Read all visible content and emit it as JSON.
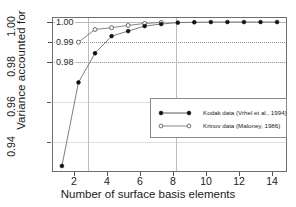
{
  "chart_data": {
    "type": "line",
    "title": "",
    "xlabel": "Number of surface basis elements",
    "ylabel": "Variance accounted for",
    "xlim": [
      0.4,
      14.6
    ],
    "ylim": [
      0.9255,
      1.0025
    ],
    "grid": true,
    "legend_position": "center-right",
    "x_ticks": [
      "2",
      "4",
      "6",
      "8",
      "10",
      "12",
      "14"
    ],
    "x_tick_values": [
      2,
      4,
      6,
      8,
      10,
      12,
      14
    ],
    "y_ticks": [
      "0.94",
      "0.96",
      "0.98",
      "1.00"
    ],
    "y_tick_values": [
      0.94,
      0.96,
      0.98,
      1.0
    ],
    "inner_y_ticks": [
      "1.00",
      "0.99",
      "0.98"
    ],
    "inner_y_tick_values": [
      1.0,
      0.99,
      0.98
    ],
    "vertical_reference_lines": [
      3,
      8
    ],
    "horizontal_reference_lines": [
      1.0,
      0.99,
      0.98
    ],
    "series": [
      {
        "name": "Kodak data (Vrhel et al., 1994)",
        "marker": "filled-circle",
        "x": [
          1,
          2,
          3,
          4,
          5,
          6,
          7,
          8,
          9,
          10,
          11,
          12,
          13,
          14
        ],
        "values": [
          0.9285,
          0.97,
          0.9845,
          0.993,
          0.9955,
          0.998,
          0.999,
          0.9997,
          0.9999,
          1.0,
          1.0,
          1.0,
          1.0,
          1.0
        ]
      },
      {
        "name": "Krinov data (Maloney, 1986)",
        "marker": "open-circle",
        "x": [
          2,
          3,
          4,
          5,
          6,
          7
        ],
        "values": [
          0.99,
          0.9963,
          0.9972,
          0.9983,
          0.9993,
          0.9998
        ]
      }
    ]
  },
  "legend": {
    "entries": [
      {
        "label": "Kodak data (Vrhel et al., 1994)",
        "marker": "filled-circle"
      },
      {
        "label": "Krinov data (Maloney, 1986)",
        "marker": "open-circle"
      }
    ]
  },
  "axes": {
    "x_label": "Number of surface basis elements",
    "y_label": "Variance accounted for"
  },
  "colors": {
    "line": "#6f6f6f",
    "marker_fill": "#111111",
    "grid": "#b9b9b9",
    "frame": "#6d6d6d",
    "text": "#1a1a1a",
    "background": "#ffffff"
  }
}
